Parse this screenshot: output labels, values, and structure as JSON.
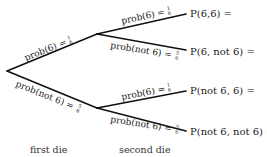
{
  "diagram": {
    "type": "probability-tree",
    "nodes": {
      "root": [
        7,
        71
      ],
      "upper": [
        97,
        34
      ],
      "lower": [
        97,
        108
      ],
      "leaf_66": [
        186,
        14
      ],
      "leaf_6n": [
        186,
        50
      ],
      "leaf_n6": [
        186,
        91
      ],
      "leaf_nn": [
        186,
        131
      ]
    },
    "branches": [
      {
        "id": "first-6",
        "label_main": "prob(6) = ",
        "num": "1",
        "den": "6"
      },
      {
        "id": "first-not6",
        "label_main": "prob(not 6) = ",
        "num": "5",
        "den": "6"
      },
      {
        "id": "upper-6",
        "label_main": "prob(6) = ",
        "num": "1",
        "den": "6"
      },
      {
        "id": "upper-not6",
        "label_main": "prob(not 6) = ",
        "num": "5",
        "den": "6"
      },
      {
        "id": "lower-6",
        "label_main": "prob(6) = ",
        "num": "1",
        "den": "6"
      },
      {
        "id": "lower-not6",
        "label_main": "prob(not 6) = ",
        "num": "5",
        "den": "6"
      }
    ],
    "outcomes": [
      "P(6,6) =",
      "P(6, not 6) =",
      "P(not 6, 6) =",
      "P(not 6, not 6) ="
    ],
    "stage_labels": {
      "first": "first die",
      "second": "second die"
    },
    "colors": {
      "line": "#111111",
      "text": "#222222",
      "background": "#ffffff"
    }
  }
}
